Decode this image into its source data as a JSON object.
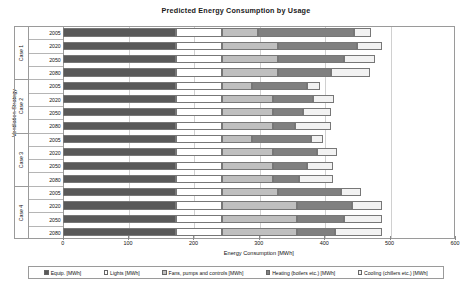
{
  "chart_data": {
    "type": "bar",
    "orientation": "horizontal",
    "stacked": true,
    "title": "Predicted Energy Consumption by Usage",
    "xlabel": "Energy Consumption [MWh]",
    "ylabel": "Ventilation Strategy",
    "xlim": [
      0,
      600
    ],
    "xticks": [
      0,
      100,
      200,
      300,
      400,
      500,
      600
    ],
    "grid": true,
    "legend_position": "bottom",
    "groups": [
      "Case 1",
      "Case 2",
      "Case 3",
      "Case 4"
    ],
    "years": [
      "2005",
      "2020",
      "2050",
      "2080"
    ],
    "categories": [
      "Case 1 2005",
      "Case 1 2020",
      "Case 1 2050",
      "Case 1 2080",
      "Case 2 2005",
      "Case 2 2020",
      "Case 2 2050",
      "Case 2 2080",
      "Case 3 2005",
      "Case 3 2020",
      "Case 3 2050",
      "Case 3 2080",
      "Case 4 2005",
      "Case 4 2020",
      "Case 4 2050",
      "Case 4 2080"
    ],
    "series": [
      {
        "name": "Equip. [MWh]",
        "color": "#595959",
        "values": [
          173,
          173,
          173,
          173,
          173,
          173,
          173,
          173,
          173,
          173,
          173,
          173,
          173,
          173,
          173,
          173
        ]
      },
      {
        "name": "Lights [MWh]",
        "color": "#ffffff",
        "values": [
          70,
          70,
          70,
          70,
          70,
          70,
          70,
          70,
          70,
          70,
          70,
          70,
          70,
          70,
          70,
          70
        ]
      },
      {
        "name": "Fans, pumps and controls [MWh]",
        "color": "#bfbfbf",
        "values": [
          55,
          87,
          87,
          87,
          47,
          78,
          78,
          78,
          47,
          78,
          78,
          78,
          87,
          115,
          115,
          115
        ]
      },
      {
        "name": "Heating (boilers etc.) [MWh]",
        "color": "#808080",
        "values": [
          148,
          120,
          100,
          80,
          83,
          62,
          47,
          35,
          90,
          68,
          52,
          40,
          95,
          85,
          72,
          58
        ]
      },
      {
        "name": "Cooling (chillers etc.) [MWh]",
        "color": "#f2f2f2",
        "values": [
          26,
          38,
          48,
          60,
          20,
          32,
          42,
          55,
          18,
          30,
          40,
          52,
          32,
          45,
          58,
          72
        ]
      }
    ]
  },
  "legend": {
    "items": [
      "Equip. [MWh]",
      "Lights [MWh]",
      "Fans, pumps and controls [MWh]",
      "Heating (boilers etc.) [MWh]",
      "Cooling (chillers etc.) [MWh]"
    ]
  }
}
